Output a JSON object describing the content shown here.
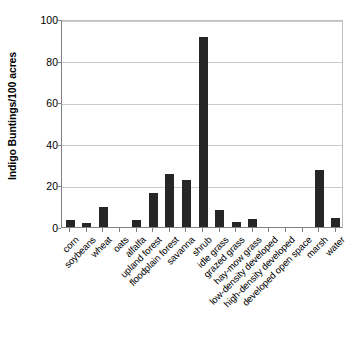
{
  "chart_data": {
    "type": "bar",
    "title": "",
    "xlabel": "",
    "ylabel": "Indigo Buntings/100 acres",
    "ylim": [
      0,
      100
    ],
    "yticks": [
      0,
      20,
      40,
      60,
      80,
      100
    ],
    "grid": true,
    "legend": "none",
    "bar_color": "#262626",
    "categories": [
      "corn",
      "soybeans",
      "wheat",
      "oats",
      "alfalfa",
      "upland forest",
      "floodplain forest",
      "savanna",
      "shrub",
      "idle grass",
      "grazed grass",
      "hay-mow grass",
      "low-density developed",
      "high-density developed",
      "developed open space",
      "marsh",
      "water"
    ],
    "values": [
      3.4,
      1.8,
      9.5,
      0,
      3.5,
      16.5,
      25.5,
      22.8,
      91.5,
      8.3,
      2.6,
      3.9,
      0,
      0,
      0,
      27.2,
      4.1
    ]
  }
}
